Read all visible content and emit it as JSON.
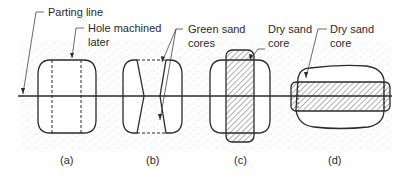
{
  "labels": {
    "parting_line": "Parting line",
    "hole_machined_1": "Hole machined",
    "hole_machined_2": "later",
    "green_sand_1": "Green sand",
    "green_sand_2": "cores",
    "dry_sand_c_1": "Dry sand",
    "dry_sand_c_2": "core",
    "dry_sand_d_1": "Dry sand",
    "dry_sand_d_2": "core"
  },
  "captions": [
    "(a)",
    "(b)",
    "(c)",
    "(d)"
  ],
  "colors": {
    "line": "#2b2b2b",
    "sand_dots": "#9a9a9a",
    "background": "#ffffff"
  }
}
